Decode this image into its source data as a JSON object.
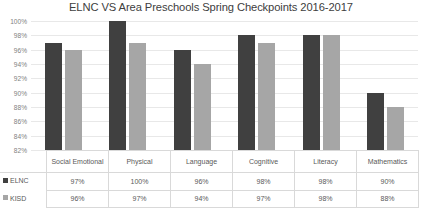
{
  "chart_data": {
    "type": "bar",
    "title": "ELNC VS Area Preschools Spring Checkpoints 2016-2017",
    "xlabel": "",
    "ylabel": "",
    "ylim": [
      82,
      100
    ],
    "ytick_step": 2,
    "grid": true,
    "legend_position": "table-left",
    "categories": [
      "Social Emotional",
      "Physical",
      "Language",
      "Cognitive",
      "Literacy",
      "Mathematics"
    ],
    "ytick_labels": [
      "100%",
      "98%",
      "96%",
      "94%",
      "92%",
      "90%",
      "88%",
      "86%",
      "84%",
      "82%"
    ],
    "ytick_values": [
      100,
      98,
      96,
      94,
      92,
      90,
      88,
      86,
      84,
      82
    ],
    "series": [
      {
        "name": "ELNC",
        "color": "#404040",
        "values": [
          97,
          100,
          96,
          98,
          98,
          90
        ],
        "labels": [
          "97%",
          "100%",
          "96%",
          "98%",
          "98%",
          "90%"
        ]
      },
      {
        "name": "KISD",
        "color": "#a6a6a6",
        "values": [
          96,
          97,
          94,
          97,
          98,
          88
        ],
        "labels": [
          "96%",
          "97%",
          "94%",
          "97%",
          "98%",
          "88%"
        ]
      }
    ]
  }
}
